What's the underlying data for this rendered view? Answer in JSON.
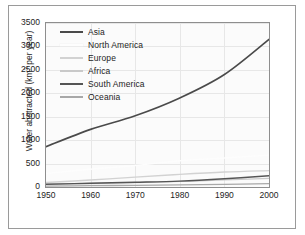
{
  "figure": {
    "background": "#ffffff",
    "frame_color": "#9a9a9a",
    "panel_background": "#fbfbfb",
    "grid_color": "#e7e7e7"
  },
  "axis": {
    "y_title_main": "Water abstracted (km",
    "y_title_sup": "3",
    "y_title_tail": " per year)",
    "y_ticks": [
      "0",
      "500",
      "1000",
      "1500",
      "2000",
      "2500",
      "3000",
      "3500"
    ],
    "x_ticks": [
      "1950",
      "1960",
      "1970",
      "1980",
      "1990",
      "2000"
    ]
  },
  "legend": {
    "items": [
      {
        "label": "Asia",
        "color": "#4a4a4a"
      },
      {
        "label": "North America",
        "color": "#fdfdfd"
      },
      {
        "label": "Europe",
        "color": "#d2d2d2"
      },
      {
        "label": "Africa",
        "color": "#c9c9c9"
      },
      {
        "label": "South America",
        "color": "#555555"
      },
      {
        "label": "Oceania",
        "color": "#a8a8a8"
      }
    ]
  },
  "chart_data": {
    "type": "line",
    "title": "",
    "xlabel": "",
    "ylabel": "Water abstracted (km3 per year)",
    "x": [
      1950,
      1960,
      1970,
      1980,
      1990,
      2000
    ],
    "xlim": [
      1950,
      2000
    ],
    "ylim": [
      0,
      3500
    ],
    "y_ticks": [
      0,
      500,
      1000,
      1500,
      2000,
      2500,
      3000,
      3500
    ],
    "x_ticks": [
      1950,
      1960,
      1970,
      1980,
      1990,
      2000
    ],
    "grid": true,
    "legend_position": "top-left inside plot",
    "series": [
      {
        "name": "Asia",
        "color": "#4a4a4a",
        "width": 1.6,
        "values": [
          860,
          1230,
          1520,
          1900,
          2400,
          3150
        ]
      },
      {
        "name": "North America",
        "color": "#fdfdfd",
        "width": 1.4,
        "values": [
          290,
          380,
          460,
          560,
          620,
          680
        ]
      },
      {
        "name": "Europe",
        "color": "#d2d2d2",
        "width": 1.4,
        "values": [
          95,
          150,
          210,
          270,
          320,
          350
        ]
      },
      {
        "name": "Africa",
        "color": "#c9c9c9",
        "width": 1.3,
        "values": [
          55,
          75,
          95,
          120,
          150,
          185
        ]
      },
      {
        "name": "South America",
        "color": "#555555",
        "width": 1.4,
        "values": [
          60,
          80,
          100,
          125,
          175,
          240
        ]
      },
      {
        "name": "Oceania",
        "color": "#a8a8a8",
        "width": 1.3,
        "values": [
          20,
          28,
          36,
          45,
          55,
          70
        ]
      }
    ]
  }
}
